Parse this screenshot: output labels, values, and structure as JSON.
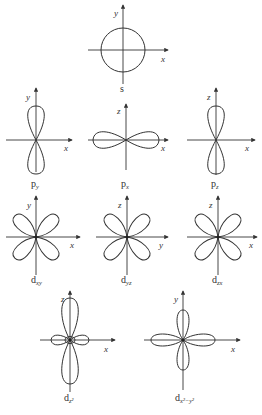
{
  "diagram": {
    "orbitals": [
      {
        "id": "s",
        "name": "s",
        "sub": "",
        "h_axis": "x",
        "v_axis": "y"
      },
      {
        "id": "py",
        "name": "p",
        "sub": "y",
        "h_axis": "x",
        "v_axis": "y"
      },
      {
        "id": "px",
        "name": "p",
        "sub": "x",
        "h_axis": "x",
        "v_axis": "z"
      },
      {
        "id": "pz",
        "name": "p",
        "sub": "z",
        "h_axis": "x",
        "v_axis": "z"
      },
      {
        "id": "dxy",
        "name": "d",
        "sub": "xy",
        "h_axis": "x",
        "v_axis": "y"
      },
      {
        "id": "dyz",
        "name": "d",
        "sub": "yz",
        "h_axis": "y",
        "v_axis": "z"
      },
      {
        "id": "dzx",
        "name": "d",
        "sub": "zx",
        "h_axis": "x",
        "v_axis": "z"
      },
      {
        "id": "dz2",
        "name": "d",
        "sub": "z²",
        "h_axis": "x",
        "v_axis": "z"
      },
      {
        "id": "dx2y2",
        "name": "d",
        "sub": "x²−y²",
        "h_axis": "x",
        "v_axis": "y"
      }
    ],
    "colors": {
      "line": "#333333",
      "background": "#ffffff"
    }
  }
}
